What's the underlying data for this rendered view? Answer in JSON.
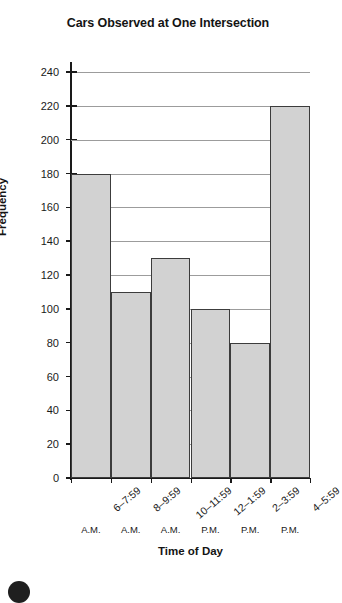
{
  "chart_data": {
    "type": "bar",
    "title": "Cars Observed at One Intersection",
    "xlabel": "Time of Day",
    "ylabel": "Frequency",
    "categories": [
      "6–7:59",
      "8–9:59",
      "10–11:59",
      "12–1:59",
      "2–3:59",
      "4–5:59"
    ],
    "category_suffixes": [
      "A.M.",
      "A.M.",
      "A.M.",
      "P.M.",
      "P.M.",
      "P.M."
    ],
    "values": [
      180,
      110,
      130,
      100,
      80,
      220
    ],
    "ylim": [
      0,
      240
    ],
    "ytick_step": 20,
    "yticks": [
      240,
      220,
      200,
      180,
      160,
      140,
      120,
      100,
      80,
      60,
      40,
      20,
      0
    ],
    "grid": "horizontal",
    "legend": "none",
    "bar_fill_color": "#d2d2d2",
    "bar_edge_color": "#3c3c3c",
    "gridline_color": "#9c9c9c",
    "axis_color": "#1a1a1a"
  },
  "figure": {
    "page_marker": ""
  }
}
